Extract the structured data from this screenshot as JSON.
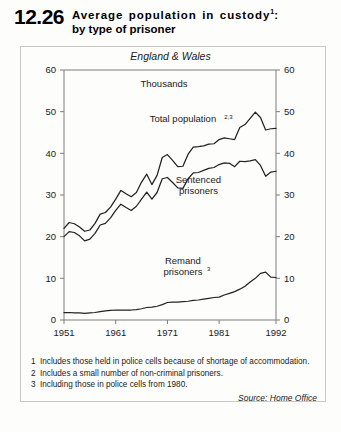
{
  "header": {
    "number": "12.26",
    "title_line1": "Average population in custody",
    "title_line1_sup": "1",
    "title_line1_colon": ":",
    "title_line2": "by type of prisoner"
  },
  "subtitle": "England & Wales",
  "footnotes": [
    {
      "num": "1",
      "text": "Includes those held in police cells because of shortage of accommodation."
    },
    {
      "num": "2",
      "text": "Includes a small number of non-criminal prisoners."
    },
    {
      "num": "3",
      "text": "Including those in police cells from 1980."
    }
  ],
  "source": "Source: Home Office",
  "chart_data": {
    "type": "line",
    "subtitle": "England & Wales",
    "units": "Thousands",
    "xlabel": "",
    "ylabel": "Thousands",
    "xlim": [
      1951,
      1992
    ],
    "ylim": [
      0,
      60
    ],
    "ytick_values": [
      0,
      10,
      20,
      30,
      40,
      50,
      60
    ],
    "ytick_labels": [
      "0",
      "10",
      "20",
      "30",
      "40",
      "50",
      "60"
    ],
    "xtick_values": [
      1951,
      1961,
      1971,
      1981,
      1992
    ],
    "xtick_labels": [
      "1951",
      "1961",
      "1971",
      "1981",
      "1992"
    ],
    "y_axis_both_sides": true,
    "grid": false,
    "legend": "inline-labels",
    "line_color": "#222222",
    "x": [
      1951,
      1952,
      1953,
      1954,
      1955,
      1956,
      1957,
      1958,
      1959,
      1960,
      1961,
      1962,
      1963,
      1964,
      1965,
      1966,
      1967,
      1968,
      1969,
      1970,
      1971,
      1972,
      1973,
      1974,
      1975,
      1976,
      1977,
      1978,
      1979,
      1980,
      1981,
      1982,
      1983,
      1984,
      1985,
      1986,
      1987,
      1988,
      1989,
      1990,
      1991,
      1992
    ],
    "series": [
      {
        "name": "Total population",
        "name_sup": "2,3",
        "label_x": 1974,
        "label_y": 47.5,
        "values": [
          22.0,
          23.4,
          23.1,
          22.3,
          21.3,
          21.6,
          23.2,
          25.4,
          25.8,
          27.1,
          29.0,
          31.1,
          30.3,
          29.6,
          30.6,
          33.1,
          35.0,
          32.5,
          34.7,
          39.0,
          39.7,
          38.3,
          36.8,
          36.9,
          39.8,
          41.5,
          41.6,
          41.8,
          42.2,
          42.3,
          43.3,
          43.7,
          43.5,
          43.3,
          46.2,
          46.9,
          48.4,
          49.9,
          48.6,
          45.6,
          45.9,
          46.0
        ]
      },
      {
        "name": "Sentenced prisoners",
        "name_sup": "",
        "label_x": 1977,
        "label_y": 33.0,
        "values": [
          20.0,
          21.2,
          21.0,
          20.2,
          19.0,
          19.4,
          20.8,
          22.8,
          23.2,
          24.5,
          26.3,
          27.8,
          27.0,
          26.3,
          27.3,
          29.0,
          30.7,
          29.0,
          30.6,
          33.9,
          34.2,
          33.0,
          31.7,
          31.6,
          33.9,
          35.3,
          35.4,
          35.9,
          36.4,
          36.6,
          37.3,
          37.7,
          37.6,
          36.8,
          38.1,
          38.0,
          38.2,
          38.5,
          37.1,
          34.5,
          35.5,
          35.7
        ]
      },
      {
        "name": "Remand prisoners",
        "name_sup": "3",
        "label_x": 1974,
        "label_y": 13.5,
        "values": [
          1.8,
          1.8,
          1.7,
          1.7,
          1.6,
          1.7,
          1.8,
          2.0,
          2.2,
          2.3,
          2.4,
          2.4,
          2.4,
          2.4,
          2.5,
          2.7,
          3.0,
          3.1,
          3.3,
          3.7,
          4.2,
          4.3,
          4.3,
          4.4,
          4.5,
          4.7,
          4.8,
          5.0,
          5.2,
          5.4,
          5.5,
          6.0,
          6.4,
          6.8,
          7.4,
          8.1,
          9.1,
          10.0,
          11.2,
          11.5,
          10.3,
          10.2
        ]
      }
    ]
  }
}
